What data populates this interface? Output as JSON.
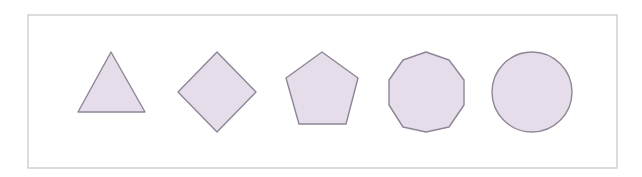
{
  "figure": {
    "width": 642,
    "height": 177,
    "background": "#ffffff",
    "frame": {
      "x": 28,
      "y": 15,
      "width": 589,
      "height": 153,
      "stroke": "#c9c9c9"
    },
    "fill_color": "#e6ddeb",
    "stroke_color": "#8e8696",
    "shapes": [
      {
        "name": "triangle",
        "sides": 3,
        "points": "111,52 145,112 78,112"
      },
      {
        "name": "square-diamond",
        "sides": 4,
        "points": "217,52 256,92 217,132 178,92"
      },
      {
        "name": "pentagon",
        "sides": 5,
        "points": "322,52 358,78 346,124 299,124 286,78"
      },
      {
        "name": "decagon",
        "sides": 10,
        "points": "426,52 449,60 464,80 464,105 449,127 426,132 403,127 389,105 389,80 403,60"
      },
      {
        "name": "circle",
        "sides": 0,
        "cx": 532,
        "cy": 92,
        "r": 40
      }
    ]
  }
}
